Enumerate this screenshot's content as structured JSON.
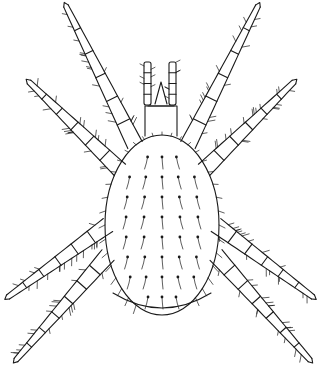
{
  "figure": {
    "style": "black ink line illustration on white",
    "colors": {
      "ink": "#1a1a1a",
      "background": "#ffffff"
    },
    "parts": {
      "body": {
        "cx": 162,
        "cy": 225,
        "rx": 57,
        "ry": 90
      },
      "gnathosoma": {
        "x": 145,
        "y": 100,
        "w": 32,
        "h": 36
      },
      "palps": [
        {
          "side": "left",
          "x1": 150,
          "y1": 105,
          "x2": 147,
          "y2": 62
        },
        {
          "side": "right",
          "x1": 172,
          "y1": 105,
          "x2": 174,
          "y2": 62
        }
      ],
      "legs": [
        {
          "id": "leg-I-left",
          "base": [
            135,
            145
          ],
          "tip": [
            66,
            6
          ],
          "segments": 6
        },
        {
          "id": "leg-II-left",
          "base": [
            120,
            170
          ],
          "tip": [
            29,
            82
          ],
          "segments": 6
        },
        {
          "id": "leg-III-left",
          "base": [
            108,
            225
          ],
          "tip": [
            8,
            297
          ],
          "segments": 6
        },
        {
          "id": "leg-IV-left",
          "base": [
            108,
            255
          ],
          "tip": [
            16,
            360
          ],
          "segments": 7
        },
        {
          "id": "leg-I-right",
          "base": [
            188,
            145
          ],
          "tip": [
            258,
            6
          ],
          "segments": 6
        },
        {
          "id": "leg-II-right",
          "base": [
            204,
            170
          ],
          "tip": [
            294,
            82
          ],
          "segments": 6
        },
        {
          "id": "leg-III-right",
          "base": [
            216,
            225
          ],
          "tip": [
            313,
            297
          ],
          "segments": 6
        },
        {
          "id": "leg-IV-right",
          "base": [
            216,
            255
          ],
          "tip": [
            310,
            360
          ],
          "segments": 7
        }
      ]
    }
  }
}
